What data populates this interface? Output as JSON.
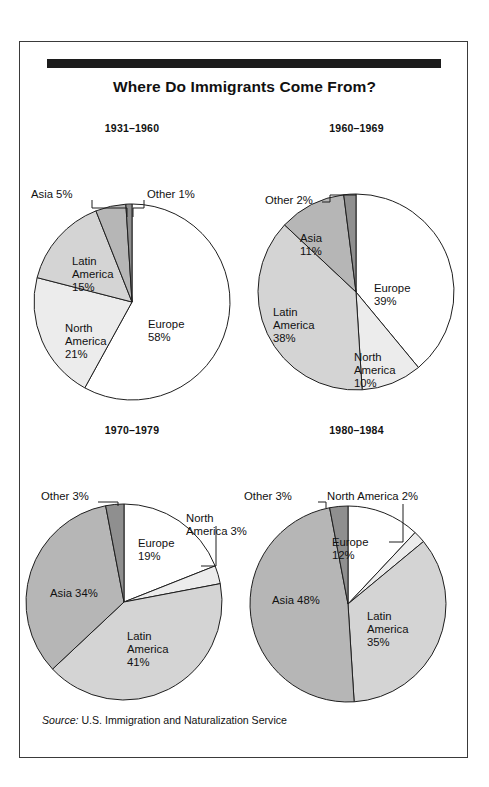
{
  "figure": {
    "title": "Where Do Immigrants Come From?",
    "source_word": "Source:",
    "source_text": " U.S. Immigration and Naturalization Service"
  },
  "palette": {
    "europe": "#ffffff",
    "north_america": "#ececec",
    "latin_america": "#d4d4d4",
    "asia": "#b6b6b6",
    "other": "#8f8f8f",
    "outline": "#1f1f1f",
    "rule": "#1c1c1c",
    "frame": "#3a3a3a",
    "text": "#111111"
  },
  "chart_data": [
    {
      "type": "pie",
      "title": "1931–1960",
      "categories": [
        "Europe",
        "North America",
        "Latin America",
        "Asia",
        "Other"
      ],
      "values": [
        58,
        21,
        15,
        5,
        1
      ],
      "labels": [
        "Europe\n58%",
        "North\nAmerica\n21%",
        "Latin\nAmerica\n15%",
        "Asia 5%",
        "Other 1%"
      ],
      "label_placement": [
        "inside",
        "inside",
        "inside",
        "callout",
        "callout"
      ],
      "unit": "%",
      "start_angle": 0,
      "direction": "clockwise"
    },
    {
      "type": "pie",
      "title": "1960–1969",
      "categories": [
        "Europe",
        "North America",
        "Latin America",
        "Asia",
        "Other"
      ],
      "values": [
        39,
        10,
        38,
        11,
        2
      ],
      "labels": [
        "Europe\n39%",
        "North\nAmerica\n10%",
        "Latin\nAmerica\n38%",
        "Asia\n11%",
        "Other 2%"
      ],
      "label_placement": [
        "inside",
        "inside",
        "inside",
        "inside",
        "callout"
      ],
      "unit": "%",
      "start_angle": 0,
      "direction": "clockwise"
    },
    {
      "type": "pie",
      "title": "1970–1979",
      "categories": [
        "Europe",
        "North America",
        "Latin America",
        "Asia",
        "Other"
      ],
      "values": [
        19,
        3,
        41,
        34,
        3
      ],
      "labels": [
        "Europe\n19%",
        "North\nAmerica 3%",
        "Latin\nAmerica\n41%",
        "Asia 34%",
        "Other 3%"
      ],
      "label_placement": [
        "inside",
        "callout",
        "inside",
        "inside",
        "callout"
      ],
      "unit": "%",
      "start_angle": 0,
      "direction": "clockwise"
    },
    {
      "type": "pie",
      "title": "1980–1984",
      "categories": [
        "Europe",
        "North America",
        "Latin America",
        "Asia",
        "Other"
      ],
      "values": [
        12,
        2,
        35,
        48,
        3
      ],
      "labels": [
        "Europe\n12%",
        "North America 2%",
        "Latin\nAmerica\n35%",
        "Asia 48%",
        "Other 3%"
      ],
      "label_placement": [
        "inside",
        "callout",
        "inside",
        "inside",
        "callout"
      ],
      "unit": "%",
      "start_angle": 0,
      "direction": "clockwise"
    }
  ]
}
